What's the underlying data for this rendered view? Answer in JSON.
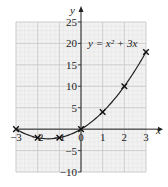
{
  "chart_data": {
    "type": "line",
    "title": "",
    "equation_label": "y = x² + 3x",
    "xlabel": "x",
    "ylabel": "y",
    "xlim": [
      -3,
      3
    ],
    "ylim": [
      -10,
      25
    ],
    "x_ticks": [
      "−3",
      "−2",
      "−1",
      "0",
      "1",
      "2",
      "3"
    ],
    "y_ticks": [
      "25",
      "20",
      "15",
      "10",
      "5",
      "−5",
      "−10"
    ],
    "grid": true,
    "points": [
      {
        "x": -3,
        "y": 0
      },
      {
        "x": -2,
        "y": -2
      },
      {
        "x": -1,
        "y": -2
      },
      {
        "x": 0,
        "y": 0
      },
      {
        "x": 1,
        "y": 4
      },
      {
        "x": 2,
        "y": 10
      },
      {
        "x": 3,
        "y": 18
      }
    ],
    "marker": "cross",
    "line_color": "#222222",
    "grid_color": "#d0d0d0",
    "background_grid_color": "#f0f0f0"
  }
}
